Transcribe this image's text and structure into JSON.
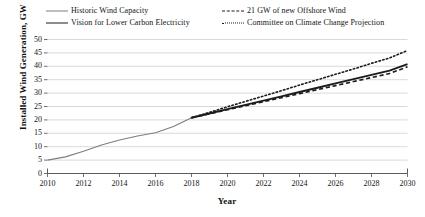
{
  "chart_data": {
    "type": "line",
    "title": "",
    "xlabel": "Year",
    "ylabel": "Installed Wind Generation, GW",
    "xlim": [
      2010,
      2030
    ],
    "ylim": [
      0,
      50
    ],
    "grid": "horizontal",
    "legend_position": "top",
    "xticks": [
      2010,
      2012,
      2014,
      2016,
      2018,
      2020,
      2022,
      2024,
      2026,
      2028,
      2030
    ],
    "yticks": [
      0,
      5,
      10,
      15,
      20,
      25,
      30,
      35,
      40,
      45,
      50
    ],
    "series": [
      {
        "name": "Historic Wind Capacity",
        "style": "solid",
        "color": "#7d7d7d",
        "width": 1.1,
        "x": [
          2010,
          2011,
          2012,
          2013,
          2014,
          2015,
          2016,
          2017,
          2018
        ],
        "values": [
          5.0,
          6.2,
          8.3,
          10.6,
          12.5,
          14.0,
          15.2,
          17.5,
          20.8
        ]
      },
      {
        "name": "Vision for Lower Carbon Electricity",
        "style": "solid",
        "color": "#1c1c1c",
        "width": 1.9,
        "x": [
          2018,
          2019,
          2020,
          2021,
          2022,
          2023,
          2024,
          2025,
          2026,
          2027,
          2028,
          2029,
          2030
        ],
        "values": [
          20.8,
          22.4,
          24.0,
          25.6,
          27.2,
          28.8,
          30.4,
          32.0,
          33.6,
          35.2,
          36.8,
          38.4,
          40.8
        ]
      },
      {
        "name": "21 GW of new Offshore Wind",
        "style": "dashed",
        "color": "#1c1c1c",
        "width": 1.6,
        "x": [
          2018,
          2019,
          2020,
          2021,
          2022,
          2023,
          2024,
          2025,
          2026,
          2027,
          2028,
          2029,
          2030
        ],
        "values": [
          20.8,
          22.3,
          23.8,
          25.3,
          26.8,
          28.3,
          29.8,
          31.3,
          32.8,
          34.3,
          35.8,
          37.3,
          39.8
        ]
      },
      {
        "name": "Committee on Climate Change Projection",
        "style": "dotted",
        "color": "#1c1c1c",
        "width": 1.6,
        "x": [
          2018,
          2019,
          2020,
          2021,
          2022,
          2023,
          2024,
          2025,
          2026,
          2027,
          2028,
          2029,
          2030
        ],
        "values": [
          20.8,
          22.8,
          24.9,
          26.9,
          28.9,
          30.9,
          33.0,
          35.0,
          37.0,
          39.0,
          41.1,
          43.1,
          45.9
        ]
      }
    ]
  },
  "legend": {
    "items": [
      {
        "label": "Historic Wind Capacity",
        "swatch": "solid-gray-line-icon"
      },
      {
        "label": "21 GW of new Offshore Wind",
        "swatch": "dashed-black-line-icon"
      },
      {
        "label": "Vision for Lower Carbon Electricity",
        "swatch": "solid-black-line-icon"
      },
      {
        "label": "Committee on Climate Change Projection",
        "swatch": "dotted-black-line-icon"
      }
    ]
  },
  "axes": {
    "y_title": "Installed Wind Generation, GW",
    "x_title": "Year",
    "y_tick_labels": [
      "0",
      "5",
      "10",
      "15",
      "20",
      "25",
      "30",
      "35",
      "40",
      "45",
      "50"
    ],
    "x_tick_labels": [
      "2010",
      "2012",
      "2014",
      "2016",
      "2018",
      "2020",
      "2022",
      "2024",
      "2026",
      "2028",
      "2030"
    ]
  },
  "colors": {
    "gridline": "#cfcfcf",
    "axis": "#4a4a4a",
    "historic": "#7d7d7d",
    "projection": "#1c1c1c",
    "background": "#ffffff"
  }
}
